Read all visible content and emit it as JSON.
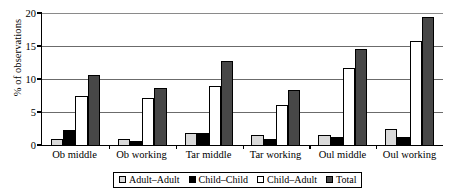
{
  "chart_data": {
    "type": "bar",
    "title": "",
    "xlabel": "",
    "ylabel": "% of observations",
    "ylim": [
      0,
      20
    ],
    "yticks": [
      0,
      5,
      10,
      15,
      20
    ],
    "ytick_labels": [
      "0",
      "5",
      "10",
      "15",
      "20"
    ],
    "grid": true,
    "legend_position": "bottom",
    "categories": [
      "Ob middle",
      "Ob working",
      "Tar middle",
      "Tar working",
      "Oul middle",
      "Oul working"
    ],
    "series": [
      {
        "name": "Adult–Adult",
        "color": "#d9d9d9",
        "values": [
          0.9,
          0.9,
          1.8,
          1.5,
          1.55,
          2.5
        ]
      },
      {
        "name": "Child–Child",
        "color": "#000000",
        "values": [
          2.3,
          0.65,
          1.75,
          0.9,
          1.15,
          1.15
        ]
      },
      {
        "name": "Child–Adult",
        "color": "#ffffff",
        "values": [
          7.4,
          7.1,
          8.9,
          6.0,
          11.65,
          15.7
        ]
      },
      {
        "name": "Total",
        "color": "#474747",
        "values": [
          10.6,
          8.7,
          12.7,
          8.4,
          14.5,
          19.4
        ]
      }
    ]
  }
}
